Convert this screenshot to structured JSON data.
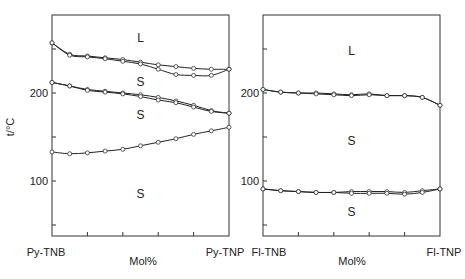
{
  "chart_data": [
    {
      "type": "line",
      "title": "",
      "xlabel": "Mol%",
      "ylabel": "t/°C",
      "x_endpoints": [
        "Py-TNB",
        "Py-TNP"
      ],
      "x": [
        0,
        10,
        20,
        30,
        40,
        50,
        60,
        70,
        80,
        90,
        100
      ],
      "ylim": [
        30,
        280
      ],
      "yticks": [
        50,
        100,
        150,
        200,
        250
      ],
      "ytick_labels": [
        "",
        "100",
        "",
        "200",
        ""
      ],
      "grid": false,
      "regions": [
        {
          "label": "L",
          "x": 50,
          "y": 262
        },
        {
          "label": "S",
          "x": 50,
          "y": 212
        },
        {
          "label": "S",
          "x": 50,
          "y": 175
        },
        {
          "label": "S",
          "x": 50,
          "y": 85
        }
      ],
      "series": [
        {
          "name": "liquidus-upper",
          "values": [
            257,
            244,
            242,
            240,
            238,
            235,
            232,
            230,
            228,
            227,
            227
          ]
        },
        {
          "name": "liquidus-lower",
          "values": [
            257,
            243,
            241,
            239,
            236,
            233,
            227,
            221,
            220,
            220,
            227
          ]
        },
        {
          "name": "transition-1a",
          "values": [
            212,
            208,
            204,
            202,
            200,
            198,
            195,
            191,
            186,
            180,
            177
          ]
        },
        {
          "name": "transition-1b",
          "values": [
            212,
            208,
            203,
            201,
            199,
            196,
            192,
            189,
            184,
            179,
            177
          ]
        },
        {
          "name": "transition-2",
          "values": [
            133,
            131,
            132,
            134,
            136,
            140,
            144,
            148,
            153,
            157,
            161
          ]
        }
      ]
    },
    {
      "type": "line",
      "title": "",
      "xlabel": "Mol%",
      "ylabel": "",
      "x_endpoints": [
        "Fl-TNB",
        "Fl-TNP"
      ],
      "x": [
        0,
        10,
        20,
        30,
        40,
        50,
        60,
        70,
        80,
        90,
        100
      ],
      "ylim": [
        30,
        280
      ],
      "yticks": [
        50,
        100,
        150,
        200,
        250
      ],
      "ytick_labels": [
        "",
        "100",
        "",
        "200",
        ""
      ],
      "grid": false,
      "regions": [
        {
          "label": "L",
          "x": 50,
          "y": 248
        },
        {
          "label": "S",
          "x": 50,
          "y": 145
        },
        {
          "label": "S",
          "x": 50,
          "y": 65
        }
      ],
      "series": [
        {
          "name": "liquidus-a",
          "values": [
            204,
            201,
            200,
            200,
            199,
            198,
            199,
            197,
            197,
            195,
            186
          ]
        },
        {
          "name": "liquidus-b",
          "values": [
            204,
            201,
            200,
            199,
            198,
            197,
            198,
            197,
            197,
            195,
            186
          ]
        },
        {
          "name": "transition-a",
          "values": [
            91,
            89,
            88,
            87,
            87,
            88,
            88,
            88,
            87,
            89,
            91
          ]
        },
        {
          "name": "transition-b",
          "values": [
            91,
            89,
            88,
            87,
            87,
            86,
            86,
            86,
            85,
            87,
            91
          ]
        }
      ]
    }
  ]
}
